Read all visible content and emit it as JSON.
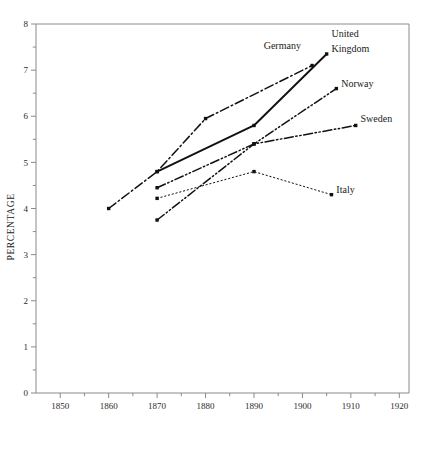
{
  "chart_data": {
    "type": "line",
    "title": "",
    "xlabel": "",
    "ylabel": "PERCENTAGE",
    "xlim": [
      1845,
      1922
    ],
    "ylim": [
      0,
      8
    ],
    "xticks": [
      1850,
      1860,
      1870,
      1880,
      1890,
      1900,
      1910,
      1920
    ],
    "xtick_labels": [
      "1850",
      "1860",
      "1870",
      "1880",
      "1890",
      "1900",
      "1910",
      "1920"
    ],
    "x_minor_ticks": [
      1855,
      1865,
      1875,
      1885,
      1895,
      1905,
      1915
    ],
    "yticks": [
      0,
      1,
      2,
      3,
      4,
      5,
      6,
      7,
      8
    ],
    "ytick_labels": [
      "0",
      "1",
      "2",
      "3",
      "4",
      "5",
      "6",
      "7",
      "8"
    ],
    "y_minor_ticks": [
      0.5,
      1.5,
      2.5,
      3.5,
      4.5,
      5.5,
      6.5,
      7.5
    ],
    "grid": false,
    "legend_position": "inline-end-of-line",
    "series": [
      {
        "name": "United Kingdom",
        "label": "United Kingdom",
        "label_lines": [
          "United",
          "Kingdom"
        ],
        "dash": "solid",
        "points": [
          [
            1870,
            4.8
          ],
          [
            1890,
            5.8
          ],
          [
            1905,
            7.35
          ]
        ]
      },
      {
        "name": "Germany",
        "label": "Germany",
        "label_lines": [
          "Germany"
        ],
        "dash": "dash-dot",
        "points": [
          [
            1860,
            4.0
          ],
          [
            1870,
            4.8
          ],
          [
            1880,
            5.95
          ],
          [
            1902,
            7.1
          ]
        ]
      },
      {
        "name": "Norway",
        "label": "Norway",
        "label_lines": [
          "Norway"
        ],
        "dash": "dash-dot-dot",
        "points": [
          [
            1870,
            3.75
          ],
          [
            1890,
            5.4
          ],
          [
            1907,
            6.6
          ]
        ]
      },
      {
        "name": "Sweden",
        "label": "Sweden",
        "label_lines": [
          "Sweden"
        ],
        "dash": "dash-dot-dot",
        "points": [
          [
            1870,
            4.45
          ],
          [
            1890,
            5.4
          ],
          [
            1911,
            5.8
          ]
        ]
      },
      {
        "name": "Italy",
        "label": "Italy",
        "label_lines": [
          "Italy"
        ],
        "dash": "dotted",
        "points": [
          [
            1870,
            4.22
          ],
          [
            1890,
            4.8
          ],
          [
            1906,
            4.3
          ]
        ]
      }
    ],
    "annotations": [
      {
        "text": "United",
        "x": 1906,
        "y": 7.72
      },
      {
        "text": "Kingdom",
        "x": 1906,
        "y": 7.4
      },
      {
        "text": "Germany",
        "x": 1892,
        "y": 7.45
      },
      {
        "text": "Norway",
        "x": 1908,
        "y": 6.63
      },
      {
        "text": "Sweden",
        "x": 1912,
        "y": 5.87
      },
      {
        "text": "Italy",
        "x": 1907,
        "y": 4.33
      }
    ]
  }
}
